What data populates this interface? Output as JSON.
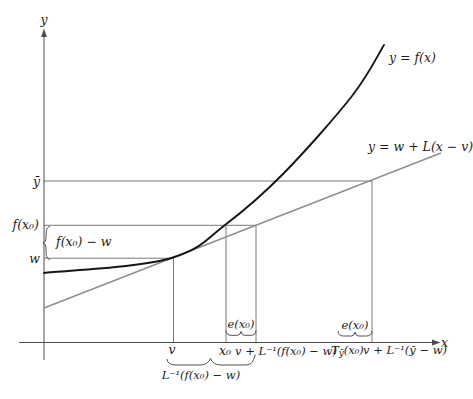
{
  "diagram": {
    "colors": {
      "curve": "#161616",
      "line": "#8e8e8e",
      "helper": "#4d4d4d",
      "text": "#1c1c1c"
    },
    "labels": {
      "y_axis": "y",
      "x_axis": "x",
      "curve": "y = f(x)",
      "tangent": "y = w + L(x − v)",
      "ybar": "ȳ",
      "fx0": "f(x₀)",
      "fx0_minus_w": "f(x₀) − w",
      "w": "w",
      "v": "v",
      "x0": "x₀",
      "v_plus_Linv_fx0_w": "v + L⁻¹(f(x₀) − w)",
      "T_base": "T",
      "T_sub": "ȳ",
      "T_args": "(x₀)",
      "v_plus_Linv_ybar_w": "v + L⁻¹(ȳ − w)",
      "e_x0_left": "e(x₀)",
      "e_x0_right": "e(x₀)",
      "Linv_fx0_w_underbrace": "L⁻¹(f(x₀) − w)"
    }
  }
}
